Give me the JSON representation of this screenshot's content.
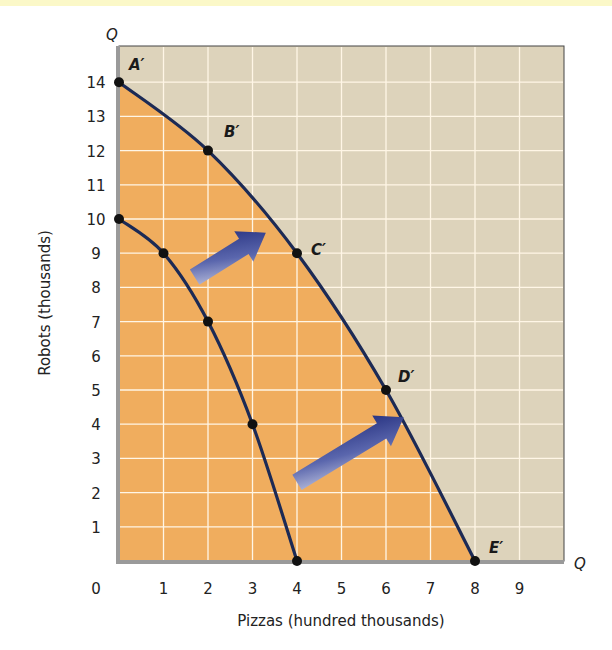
{
  "chart_data": {
    "type": "line",
    "title": "",
    "xlabel": "Pizzas (hundred thousands)",
    "ylabel": "Robots (thousands)",
    "x_axis_end_label": "Q",
    "y_axis_end_label": "Q",
    "xlim": [
      0,
      10
    ],
    "ylim": [
      0,
      15
    ],
    "grid": true,
    "x_ticks": [
      "0",
      "1",
      "2",
      "3",
      "4",
      "5",
      "6",
      "7",
      "8",
      "9"
    ],
    "y_ticks": [
      "1",
      "2",
      "3",
      "4",
      "5",
      "6",
      "7",
      "8",
      "9",
      "10",
      "11",
      "12",
      "13",
      "14"
    ],
    "series": [
      {
        "name": "Original PPF",
        "points": [
          {
            "x": 0,
            "y": 10
          },
          {
            "x": 1,
            "y": 9
          },
          {
            "x": 2,
            "y": 7
          },
          {
            "x": 3,
            "y": 4
          },
          {
            "x": 4,
            "y": 0
          }
        ]
      },
      {
        "name": "Shifted PPF",
        "points": [
          {
            "x": 0,
            "y": 14,
            "label": "A′"
          },
          {
            "x": 2,
            "y": 12,
            "label": "B′"
          },
          {
            "x": 4,
            "y": 9,
            "label": "C′"
          },
          {
            "x": 6,
            "y": 5,
            "label": "D′"
          },
          {
            "x": 8,
            "y": 0,
            "label": "E′"
          }
        ]
      }
    ],
    "annotations": [
      {
        "type": "arrow",
        "description": "outward shift arrow",
        "from": [
          1.7,
          8.3
        ],
        "to": [
          3.3,
          9.6
        ]
      },
      {
        "type": "arrow",
        "description": "outward shift arrow",
        "from": [
          4.0,
          2.3
        ],
        "to": [
          6.4,
          4.2
        ]
      }
    ],
    "colors": {
      "attainable_region": "#f0ad5e",
      "unattainable_region": "#ddd3bb",
      "curve": "#1c2a55",
      "arrow": "#2d3a8c",
      "grid": "#fff6e6"
    }
  }
}
